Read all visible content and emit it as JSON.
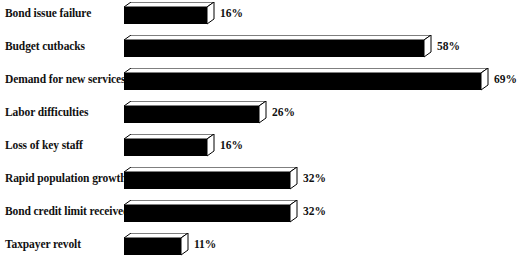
{
  "chart_data": {
    "type": "bar",
    "orientation": "horizontal",
    "title": "",
    "subtitle": "",
    "xlabel": "",
    "ylabel": "",
    "xlim": [
      0,
      75
    ],
    "grid": false,
    "legend": null,
    "value_suffix": "%",
    "categories": [
      "Bond issue failure",
      "Budget cutbacks",
      "Demand for new services",
      "Labor difficulties",
      "Loss of key staff",
      "Rapid population growth",
      "Bond credit limit received",
      "Taxpayer revolt"
    ],
    "values": [
      16,
      58,
      69,
      26,
      16,
      32,
      32,
      11
    ],
    "data_labels": [
      "16%",
      "58%",
      "69%",
      "26%",
      "16%",
      "32%",
      "32%",
      "11%"
    ],
    "colors": {
      "bar_fill": "#000000",
      "bar_outline": "#000000",
      "bar_side": "#ffffff",
      "background": "#ffffff",
      "text": "#111111"
    }
  }
}
